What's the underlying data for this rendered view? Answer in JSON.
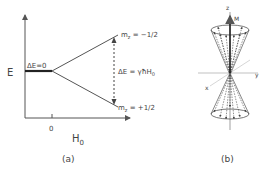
{
  "panel_a": {
    "y_axis_label": "E",
    "x_axis_label_main": "H",
    "x_axis_label_sub": "0",
    "x_tick_label": "0",
    "zero_field_label": "ΔE=0",
    "upper_level_label": "m",
    "upper_level_sub": "z",
    "upper_level_value": " = −1/2",
    "lower_level_label": "m",
    "lower_level_sub": "z",
    "lower_level_value": " = +1/2",
    "splitting_label": "ΔE = γħH",
    "splitting_sub": "0",
    "caption": "(a)"
  },
  "panel_b": {
    "z_axis_label": "z",
    "magnetization_label": "M",
    "y_axis_label": "y",
    "x_axis_label": "x",
    "caption": "(b)"
  },
  "colors": {
    "line": "#555555",
    "text": "#444444",
    "background": "#ffffff"
  }
}
